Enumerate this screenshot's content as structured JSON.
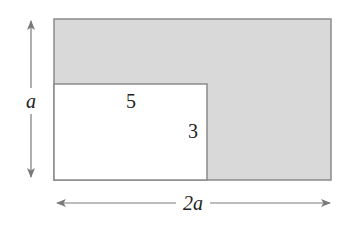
{
  "diagram": {
    "type": "geometry-area",
    "colors": {
      "shaded_fill": "#d9d9d9",
      "stroke": "#8a8a8a",
      "arrow": "#7a7a7a",
      "text": "#222222",
      "background": "#ffffff"
    },
    "outer_rectangle": {
      "width_label": "2a",
      "height_label": "a"
    },
    "inner_rectangle": {
      "width_label": "5",
      "height_label": "3"
    },
    "labels": {
      "outer_height": "a",
      "outer_width": "2a",
      "inner_width": "5",
      "inner_height": "3"
    }
  }
}
